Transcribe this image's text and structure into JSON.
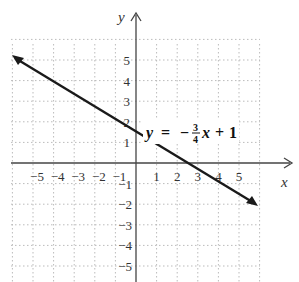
{
  "chart_data": {
    "type": "line",
    "title": "",
    "equation": {
      "lhs": "y",
      "equals": "=",
      "minus": "−",
      "numerator": "3",
      "denominator": "4",
      "var": "x",
      "plus": "+",
      "constant": "1",
      "full_text": "y = −(3/4)x + 1"
    },
    "slope": -0.75,
    "intercept": 1,
    "series": [
      {
        "name": "y = -3/4 x + 1",
        "x": [
          -6.2,
          6
        ],
        "y": [
          5.65,
          -3.5
        ]
      }
    ],
    "xlabel": "x",
    "ylabel": "y",
    "x_ticks": [
      "−5",
      "−4",
      "−3",
      "−2",
      "−1",
      "1",
      "2",
      "3",
      "4",
      "5"
    ],
    "y_ticks_pos": [
      "5",
      "4",
      "3",
      "2",
      "1"
    ],
    "y_ticks_neg": [
      "−1",
      "−2",
      "−3",
      "−4",
      "−5"
    ],
    "xlim": [
      -6,
      6
    ],
    "ylim": [
      -5.9,
      6
    ],
    "grid": true,
    "grid_style": "dotted",
    "line_color": "#1a1a1a",
    "axis_color": "#444444",
    "grid_color": "#bbbbbb"
  }
}
